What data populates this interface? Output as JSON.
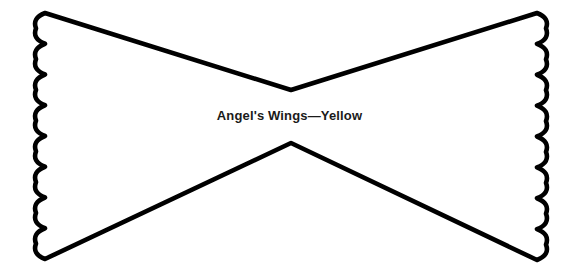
{
  "page": {
    "background_color": "#ffffff",
    "width": 579,
    "height": 278
  },
  "template": {
    "name": "angel-wings-template",
    "caption": "Angel's Wings—Yellow",
    "caption_color": "#1a1a1a",
    "outline_color": "#000000",
    "fill_color": "#ffffff",
    "stroke_width": 4.6,
    "shape_type": "bow-tie",
    "edges": {
      "left": "scalloped",
      "right": "scalloped",
      "top": "straight-diagonal",
      "bottom": "straight-diagonal"
    },
    "scallop_count_left": 8,
    "scallop_count_right": 8,
    "geometry": {
      "top_left_corner": [
        45,
        13
      ],
      "top_right_corner": [
        537,
        13
      ],
      "bottom_left_corner": [
        45,
        259
      ],
      "bottom_right_corner": [
        537,
        260
      ],
      "upper_center_notch": [
        291,
        90
      ],
      "lower_center_notch": [
        291,
        143
      ],
      "left_edge_x": 37,
      "right_edge_x": 545,
      "scallop_amplitude": 9
    }
  }
}
